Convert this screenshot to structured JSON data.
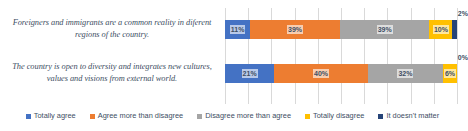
{
  "chart_data": {
    "type": "bar",
    "subtype": "100% stacked horizontal bar",
    "title": "",
    "xlabel": "",
    "ylabel": "",
    "xlim": [
      0,
      100
    ],
    "grid": true,
    "grid_interval": 10,
    "legend_position": "bottom",
    "value_suffix": "%",
    "categories": [
      "Foreigners and immigrants are a common reality in diferent regions of the country.",
      "The country is open to diversity and integrates new cultures, values and visions from external world."
    ],
    "series": [
      {
        "name": "Totally agree",
        "color": "#4472C4",
        "values": [
          11,
          21
        ]
      },
      {
        "name": "Agree more than disagree",
        "color": "#ED7D31",
        "values": [
          39,
          40
        ]
      },
      {
        "name": "Disagree more than agree",
        "color": "#A5A5A5",
        "values": [
          39,
          32
        ]
      },
      {
        "name": "Totally disagree",
        "color": "#FFC000",
        "values": [
          10,
          6
        ]
      },
      {
        "name": "It doesn't matter",
        "color": "#264478",
        "values": [
          2,
          0
        ]
      }
    ],
    "data_labels": [
      [
        "11%",
        "39%",
        "39%",
        "10%",
        "2%"
      ],
      [
        "21%",
        "40%",
        "32%",
        "6%",
        "0%"
      ]
    ]
  },
  "legend": {
    "items": [
      {
        "label": "Totally agree",
        "color": "#4472C4"
      },
      {
        "label": "Agree more than disagree",
        "color": "#ED7D31"
      },
      {
        "label": "Disagree more than agree",
        "color": "#A5A5A5"
      },
      {
        "label": "Totally disagree",
        "color": "#FFC000"
      },
      {
        "label": "It doesn't matter",
        "color": "#264478"
      }
    ]
  }
}
